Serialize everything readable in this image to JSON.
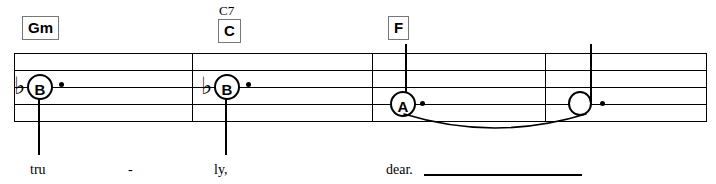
{
  "score": {
    "staff": {
      "line_count": 5,
      "left": 14,
      "right": 707,
      "top": 53,
      "bottom": 121,
      "line_spacing": 17,
      "color": "#000000"
    },
    "barlines": [
      {
        "name": "barline-1",
        "x": 192
      },
      {
        "name": "barline-2",
        "x": 372
      },
      {
        "name": "barline-3",
        "x": 545
      }
    ],
    "chords": [
      {
        "id": "chord-gm",
        "label": "Gm",
        "superscript": "",
        "x": 22,
        "y": 16
      },
      {
        "id": "chord-c",
        "label": "C",
        "superscript": "C7",
        "x": 218,
        "y": 16
      },
      {
        "id": "chord-f",
        "label": "F",
        "superscript": "",
        "x": 388,
        "y": 16
      }
    ],
    "notes": [
      {
        "id": "note-1",
        "letter": "B",
        "accidental": "♭",
        "head": "letter",
        "dotted": true,
        "stem": "down",
        "tie_start": false,
        "x": 27,
        "y": 74
      },
      {
        "id": "note-2",
        "letter": "B",
        "accidental": "♭",
        "head": "letter",
        "dotted": true,
        "stem": "down",
        "tie_start": false,
        "x": 214,
        "y": 74
      },
      {
        "id": "note-3",
        "letter": "A",
        "accidental": "",
        "head": "letter",
        "dotted": true,
        "stem": "up",
        "tie_start": true,
        "x": 390,
        "y": 91
      },
      {
        "id": "note-4",
        "letter": "",
        "accidental": "",
        "head": "open",
        "dotted": true,
        "stem": "up",
        "tie_start": false,
        "x": 568,
        "y": 91
      }
    ],
    "tie": {
      "name": "tie-slur",
      "from_x": 404,
      "to_x": 582,
      "y": 118,
      "depth": 16
    },
    "lyrics": [
      {
        "id": "lyric-1",
        "text": "tru",
        "x": 30,
        "y": 163
      },
      {
        "id": "lyric-2",
        "text": "-",
        "x": 128,
        "y": 163
      },
      {
        "id": "lyric-3",
        "text": "ly,",
        "x": 214,
        "y": 163
      },
      {
        "id": "lyric-4",
        "text": "dear.",
        "x": 386,
        "y": 163
      }
    ],
    "lyric_extender": {
      "name": "melisma-line",
      "x": 424,
      "y": 174,
      "width": 158
    }
  }
}
